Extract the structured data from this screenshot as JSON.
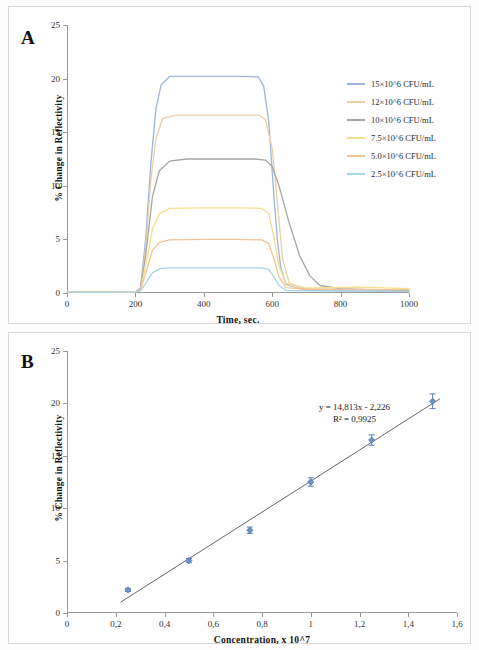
{
  "figure": {
    "panel_a_letter": "A",
    "panel_b_letter": "B"
  },
  "panel_a": {
    "ylabel": "% Change in Reflectivity",
    "xlabel": "Time, sec.",
    "yticks": [
      "0",
      "5",
      "10",
      "15",
      "20",
      "25"
    ],
    "xticks": [
      "0",
      "200",
      "400",
      "600",
      "800",
      "1000"
    ],
    "legend": [
      {
        "label": "15×10^6 CFU/mL",
        "color": "#9cb5d8"
      },
      {
        "label": "12×10^6 CFU/mL",
        "color": "#e8cfa8"
      },
      {
        "label": "10×10^6 CFU/mL",
        "color": "#a6a6a6"
      },
      {
        "label": "7.5×10^6 CFU/mL",
        "color": "#f2df8a"
      },
      {
        "label": "5.0×10^6 CFU/mL",
        "color": "#f0c49a"
      },
      {
        "label": "2.5×10^6 CFU/mL",
        "color": "#a8d4e8"
      }
    ]
  },
  "panel_b": {
    "ylabel": "% Change in Reflectivity",
    "xlabel": "Concentration,  x 10^7",
    "yticks": [
      "0",
      "5",
      "10",
      "15",
      "20",
      "25"
    ],
    "xticks": [
      "0",
      "0,2",
      "0,4",
      "0,6",
      "0,8",
      "1",
      "1,2",
      "1,4",
      "1,6"
    ],
    "equation": "y = 14,813x  - 2,226",
    "r_squared": "R² = 0,9925"
  },
  "chart_data": [
    {
      "type": "line",
      "title": "A",
      "xlabel": "Time, sec.",
      "ylabel": "% Change in Reflectivity",
      "xlim": [
        0,
        1000
      ],
      "ylim": [
        0,
        25
      ],
      "grid": false,
      "legend_position": "right",
      "series": [
        {
          "name": "15×10^6 CFU/mL",
          "color": "#9cb5d8",
          "x": [
            0,
            100,
            200,
            215,
            230,
            245,
            260,
            275,
            300,
            350,
            450,
            520,
            560,
            575,
            590,
            605,
            615,
            625,
            640,
            700,
            800,
            1000
          ],
          "y": [
            0.05,
            0.05,
            0.08,
            0.5,
            5.0,
            12.0,
            17.2,
            19.4,
            20.2,
            20.2,
            20.2,
            20.2,
            20.15,
            19.3,
            16.0,
            9.0,
            5.0,
            2.4,
            0.8,
            0.25,
            0.2,
            0.15
          ]
        },
        {
          "name": "12×10^6 CFU/mL",
          "color": "#e8cfa8",
          "x": [
            0,
            100,
            200,
            215,
            230,
            245,
            260,
            280,
            320,
            400,
            500,
            560,
            580,
            600,
            615,
            630,
            650,
            700,
            800,
            1000
          ],
          "y": [
            0.05,
            0.05,
            0.08,
            0.4,
            4.2,
            10.5,
            14.4,
            16.3,
            16.6,
            16.6,
            16.6,
            16.6,
            16.2,
            13.5,
            8.5,
            3.2,
            0.9,
            0.4,
            0.3,
            0.25
          ]
        },
        {
          "name": "10×10^6 CFU/mL",
          "color": "#a6a6a6",
          "x": [
            0,
            100,
            200,
            215,
            230,
            250,
            270,
            300,
            350,
            450,
            550,
            580,
            600,
            620,
            650,
            680,
            710,
            740,
            800,
            900,
            1000
          ],
          "y": [
            0.05,
            0.05,
            0.08,
            0.4,
            3.5,
            9.0,
            11.4,
            12.3,
            12.5,
            12.5,
            12.5,
            12.4,
            11.8,
            10.0,
            6.5,
            3.5,
            1.6,
            0.7,
            0.4,
            0.3,
            0.25
          ]
        },
        {
          "name": "7.5×10^6 CFU/mL",
          "color": "#f2df8a",
          "x": [
            0,
            100,
            200,
            215,
            230,
            250,
            270,
            300,
            400,
            500,
            570,
            590,
            605,
            620,
            640,
            680,
            760,
            850,
            1000
          ],
          "y": [
            0.05,
            0.05,
            0.08,
            0.3,
            2.5,
            6.0,
            7.4,
            7.9,
            7.95,
            7.95,
            7.9,
            7.4,
            5.2,
            2.5,
            0.9,
            0.45,
            0.5,
            0.55,
            0.4
          ]
        },
        {
          "name": "5.0×10^6 CFU/mL",
          "color": "#f0c49a",
          "x": [
            0,
            100,
            200,
            215,
            230,
            250,
            270,
            300,
            400,
            500,
            570,
            590,
            605,
            620,
            640,
            700,
            800,
            1000
          ],
          "y": [
            0.05,
            0.05,
            0.08,
            0.3,
            1.8,
            4.0,
            4.7,
            4.95,
            5.0,
            5.0,
            4.95,
            4.6,
            3.2,
            1.5,
            0.5,
            0.35,
            0.35,
            0.3
          ]
        },
        {
          "name": "2.5×10^6 CFU/mL",
          "color": "#a8d4e8",
          "x": [
            0,
            100,
            200,
            215,
            230,
            250,
            275,
            300,
            400,
            500,
            570,
            590,
            605,
            620,
            640,
            700,
            800,
            1000
          ],
          "y": [
            0.05,
            0.05,
            0.08,
            0.2,
            0.9,
            1.9,
            2.3,
            2.35,
            2.35,
            2.35,
            2.35,
            2.2,
            1.5,
            0.7,
            0.25,
            0.2,
            0.2,
            0.15
          ]
        }
      ]
    },
    {
      "type": "scatter",
      "title": "B",
      "xlabel": "Concentration,  x 10^7",
      "ylabel": "% Change in Reflectivity",
      "xlim": [
        0,
        1.6
      ],
      "ylim": [
        0,
        25
      ],
      "grid": false,
      "marker_color": "#6f8fc4",
      "fit_line_color": "#555555",
      "annotations": [
        "y = 14,813x  - 2,226",
        "R² = 0,9925"
      ],
      "x": [
        0.25,
        0.5,
        0.75,
        1.0,
        1.25,
        1.5
      ],
      "y": [
        2.2,
        5.0,
        7.9,
        12.5,
        16.5,
        20.2
      ],
      "yerr": [
        0.15,
        0.2,
        0.3,
        0.4,
        0.5,
        0.7
      ],
      "fit": {
        "slope": 14.813,
        "intercept": -2.226,
        "r2": 0.9925
      }
    }
  ]
}
